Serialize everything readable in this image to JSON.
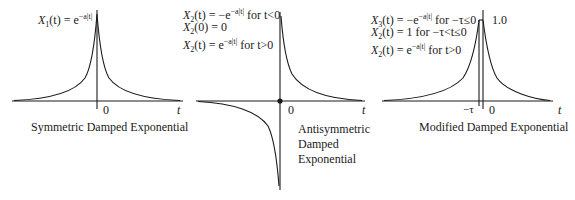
{
  "panels": [
    {
      "id": "symmetric",
      "equations": [
        "X1(t) = e^(−a|t|)"
      ],
      "eq_parts": [
        {
          "lhs": "X",
          "sub": "1",
          "arg": "(t) = e",
          "exp": "−a|t|",
          "tail": ""
        }
      ],
      "origin_label": "0",
      "axis_label": "t",
      "caption": "Symmetric Damped Exponential"
    },
    {
      "id": "antisymmetric",
      "equations": [
        "X2(t) = −e^(−a|t|) for t<0",
        "X2(0) = 0",
        "X2(t) = e^(−a|t|) for t>0"
      ],
      "eq_parts": [
        {
          "lhs": "X",
          "sub": "2",
          "arg": "(t) = −e",
          "exp": "−a|t|",
          "tail": " for t<0"
        },
        {
          "lhs": "X",
          "sub": "2",
          "arg": "(0) = 0",
          "exp": "",
          "tail": ""
        },
        {
          "lhs": "X",
          "sub": "2",
          "arg": "(t) = e",
          "exp": "−a|t|",
          "tail": " for t>0"
        }
      ],
      "origin_label": "0",
      "axis_label": "t",
      "caption_lines": [
        "Antisymmetric",
        "Damped",
        "Exponential"
      ]
    },
    {
      "id": "modified",
      "equations": [
        "X3(t) = −e^(−a|t|) for −τ≤0",
        "X2(t) = 1 for −τ<t≤0",
        "X2(t) = e^(−a|t|) for t>0"
      ],
      "eq_parts": [
        {
          "lhs": "X",
          "sub": "3",
          "arg": "(t) = −e",
          "exp": "−a|t|",
          "tail": " for −τ≤0"
        },
        {
          "lhs": "X",
          "sub": "2",
          "arg": "(t) = 1",
          "exp": "",
          "tail": " for −τ<t≤0"
        },
        {
          "lhs": "X",
          "sub": "2",
          "arg": "(t) = e",
          "exp": "−a|t|",
          "tail": " for t>0"
        }
      ],
      "peak_label": "1.0",
      "tau_label": "−τ",
      "origin_label": "0",
      "axis_label": "t",
      "caption": "Modified Damped Exponential"
    }
  ],
  "colors": {
    "line": "#1a1a1a",
    "background": "#ffffff"
  }
}
